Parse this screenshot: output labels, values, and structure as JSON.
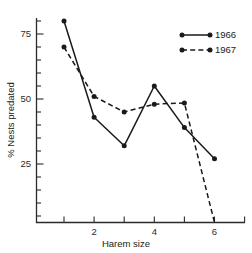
{
  "chart_data": {
    "type": "line",
    "title": "",
    "xlabel": "Harem size",
    "ylabel": "% Nests predated",
    "x": [
      1,
      2,
      3,
      4,
      5,
      6
    ],
    "xlim": [
      0.45,
      7.0
    ],
    "ylim": [
      2.5,
      81.5
    ],
    "xticks": [
      1,
      2,
      3,
      4,
      5,
      6,
      7
    ],
    "xtick_labels": [
      "",
      "2",
      "",
      "4",
      "",
      "6",
      ""
    ],
    "yticks": [
      25,
      50,
      75
    ],
    "ytick_labels": [
      "25",
      "50",
      "75"
    ],
    "yminor_step": 5,
    "grid": false,
    "legend_position": "top-right",
    "series": [
      {
        "name": "1966",
        "style": "solid",
        "color": "#1a1a1a",
        "x": [
          1,
          2,
          3,
          4,
          5,
          6
        ],
        "values": [
          80,
          43,
          32,
          55,
          39,
          27
        ]
      },
      {
        "name": "1967",
        "style": "dashed",
        "color": "#1a1a1a",
        "x": [
          1,
          2,
          3,
          4,
          5,
          6
        ],
        "values": [
          70,
          51,
          45,
          48,
          48.5,
          0
        ]
      }
    ]
  },
  "axes": {
    "ylabel": "% Nests predated",
    "xlabel": "Harem size",
    "ytick_labels": [
      "75",
      "50",
      "25"
    ],
    "xtick_labels": [
      "2",
      "4",
      "6"
    ]
  },
  "legend": {
    "entries": [
      {
        "label": "1966"
      },
      {
        "label": "1967"
      }
    ]
  }
}
